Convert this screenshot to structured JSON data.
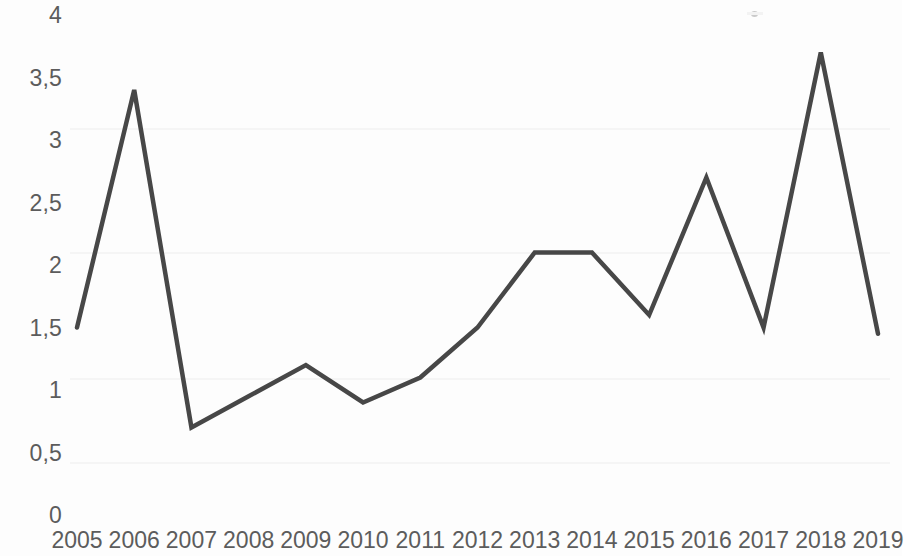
{
  "chart_data": {
    "type": "line",
    "title": "",
    "subtitle": "",
    "xlabel": "",
    "ylabel": "",
    "categories": [
      "2005",
      "2006",
      "2007",
      "2008",
      "2009",
      "2010",
      "2011",
      "2012",
      "2013",
      "2014",
      "2015",
      "2016",
      "2017",
      "2018",
      "2019"
    ],
    "series": [
      {
        "name": "",
        "values": [
          1.5,
          3.4,
          0.7,
          0.95,
          1.2,
          0.9,
          1.1,
          1.5,
          2.1,
          2.1,
          1.6,
          2.7,
          1.5,
          3.7,
          1.45
        ]
      }
    ],
    "ylim": [
      0,
      4
    ],
    "ytick_values": [
      0,
      0.5,
      1,
      1.5,
      2,
      2.5,
      3,
      3.5,
      4
    ],
    "ytick_labels": [
      "0",
      "0,5",
      "1",
      "1,5",
      "2",
      "2,5",
      "3",
      "3,5",
      "4"
    ],
    "decimal_separator": ",",
    "grid": false,
    "legend": "none",
    "line_color": "#474747",
    "line_width": 4.5,
    "markers": false,
    "background_color": "#fdfdfd",
    "axis_label_color": "#5c5c5c",
    "annotations": []
  },
  "artifacts": {
    "speck_label": "scan-speck"
  }
}
